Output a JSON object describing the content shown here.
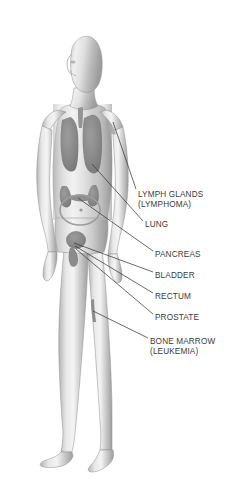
{
  "figure": {
    "style": "grayscale-airbrush-illustration",
    "background_color": "#ffffff",
    "skin_tone": "#d8d8d8",
    "organ_color": "#8a8a8a",
    "outline_color": "#6e6e6e",
    "leader_line_color": "#3a3a3a",
    "text_color": "#3b3b3b"
  },
  "annotations": [
    {
      "id": "lymph-glands",
      "label": "LYMPH GLANDS",
      "sublabel": "(LYMPHOMA)",
      "text_x": 138,
      "text_y": 190,
      "leader": {
        "x1": 136,
        "y1": 189,
        "x2": 113,
        "y2": 122
      }
    },
    {
      "id": "lung",
      "label": "LUNG",
      "sublabel": "",
      "text_x": 145,
      "text_y": 220,
      "leader": {
        "x1": 143,
        "y1": 221,
        "x2": 92,
        "y2": 164
      }
    },
    {
      "id": "pancreas",
      "label": "PANCREAS",
      "sublabel": "",
      "text_x": 155,
      "text_y": 250,
      "leader": {
        "x1": 153,
        "y1": 251,
        "x2": 78,
        "y2": 198
      }
    },
    {
      "id": "bladder",
      "label": "BLADDER",
      "sublabel": "",
      "text_x": 155,
      "text_y": 271,
      "leader": {
        "x1": 153,
        "y1": 272,
        "x2": 74,
        "y2": 243
      }
    },
    {
      "id": "rectum",
      "label": "RECTUM",
      "sublabel": "",
      "text_x": 155,
      "text_y": 292,
      "leader": {
        "x1": 153,
        "y1": 293,
        "x2": 75,
        "y2": 246
      }
    },
    {
      "id": "prostate",
      "label": "PROSTATE",
      "sublabel": "",
      "text_x": 155,
      "text_y": 313,
      "leader": {
        "x1": 153,
        "y1": 314,
        "x2": 76,
        "y2": 249
      }
    },
    {
      "id": "bone-marrow",
      "label": "BONE MARROW",
      "sublabel": "(LEUKEMIA)",
      "text_x": 150,
      "text_y": 337,
      "leader": {
        "x1": 148,
        "y1": 338,
        "x2": 93,
        "y2": 311
      }
    }
  ]
}
